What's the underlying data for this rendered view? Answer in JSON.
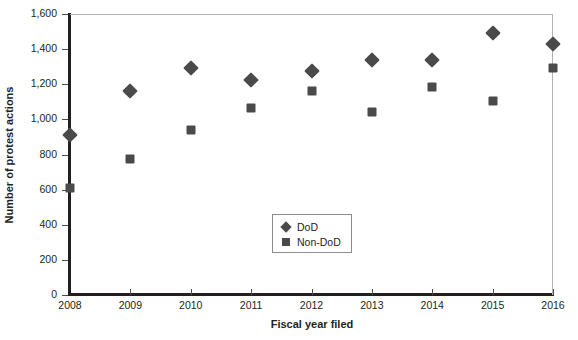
{
  "chart_data": {
    "type": "scatter",
    "title": "",
    "xlabel": "Fiscal year filed",
    "ylabel": "Number of protest actions",
    "categories": [
      "2008",
      "2009",
      "2010",
      "2011",
      "2012",
      "2013",
      "2014",
      "2015",
      "2016"
    ],
    "x": [
      2008,
      2009,
      2010,
      2011,
      2012,
      2013,
      2014,
      2015,
      2016
    ],
    "series": [
      {
        "name": "DoD",
        "marker": "diamond",
        "color": "#4a4a4a",
        "values": [
          912,
          1160,
          1292,
          1224,
          1276,
          1336,
          1338,
          1492,
          1432
        ]
      },
      {
        "name": "Non-DoD",
        "marker": "square",
        "color": "#4a4a4a",
        "values": [
          612,
          774,
          938,
          1062,
          1160,
          1044,
          1182,
          1106,
          1292
        ]
      }
    ],
    "xlim": [
      2008,
      2016
    ],
    "ylim": [
      0,
      1600
    ],
    "yticks": [
      0,
      200,
      400,
      600,
      800,
      1000,
      1200,
      1400,
      1600
    ],
    "ytick_labels": [
      "0",
      "200",
      "400",
      "600",
      "800",
      "1,000",
      "1,200",
      "1,400",
      "1,600"
    ],
    "xtick_labels": [
      "2008",
      "2009",
      "2010",
      "2011",
      "2012",
      "2013",
      "2014",
      "2015",
      "2016"
    ],
    "grid": false,
    "legend_position": "center"
  },
  "legend": {
    "entries": [
      {
        "label": "DoD",
        "marker": "diamond"
      },
      {
        "label": "Non-DoD",
        "marker": "square"
      }
    ]
  },
  "axes": {
    "x_title": "Fiscal year filed",
    "y_title": "Number of protest actions"
  },
  "colors": {
    "marker": "#4a4a4a",
    "axis": "#231f20",
    "frame": "#b3b3b3",
    "background": "#ffffff"
  }
}
